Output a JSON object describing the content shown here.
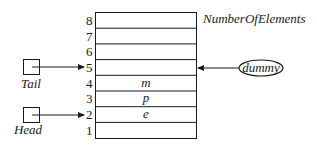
{
  "diagram": {
    "type": "array-queue",
    "header_label": "NumberOfElements",
    "cells": [
      {
        "index": "8",
        "value": ""
      },
      {
        "index": "7",
        "value": ""
      },
      {
        "index": "6",
        "value": ""
      },
      {
        "index": "5",
        "value": ""
      },
      {
        "index": "4",
        "value": "m"
      },
      {
        "index": "3",
        "value": "p"
      },
      {
        "index": "2",
        "value": "e"
      },
      {
        "index": "1",
        "value": ""
      }
    ],
    "pointers": {
      "tail": {
        "label": "Tail",
        "points_to": "5"
      },
      "head": {
        "label": "Head",
        "points_to": "2"
      }
    },
    "dummy": {
      "label": "dummy",
      "points_to": "5"
    }
  }
}
